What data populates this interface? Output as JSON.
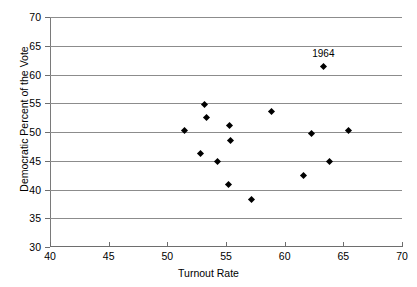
{
  "chart_data": {
    "type": "scatter",
    "title": "",
    "xlabel": "Turnout Rate",
    "ylabel": "Democratic Percent of the Vote",
    "xlim": [
      40,
      70
    ],
    "ylim": [
      30,
      70
    ],
    "xticks": [
      40,
      45,
      50,
      55,
      60,
      65,
      70
    ],
    "yticks": [
      30,
      35,
      40,
      45,
      50,
      55,
      60,
      65,
      70
    ],
    "grid": "horizontal",
    "legend": "none",
    "marker": "filled-diamond",
    "marker_color": "#000000",
    "points": [
      {
        "x": 51.5,
        "y": 50.3
      },
      {
        "x": 52.8,
        "y": 46.2
      },
      {
        "x": 53.2,
        "y": 54.8
      },
      {
        "x": 53.3,
        "y": 52.5
      },
      {
        "x": 54.3,
        "y": 44.8
      },
      {
        "x": 55.3,
        "y": 51.2
      },
      {
        "x": 55.4,
        "y": 48.6
      },
      {
        "x": 55.2,
        "y": 40.8
      },
      {
        "x": 57.2,
        "y": 38.3
      },
      {
        "x": 58.9,
        "y": 53.6
      },
      {
        "x": 61.6,
        "y": 42.5
      },
      {
        "x": 62.3,
        "y": 49.7
      },
      {
        "x": 63.3,
        "y": 61.4,
        "label": "1964"
      },
      {
        "x": 63.8,
        "y": 44.8
      },
      {
        "x": 65.4,
        "y": 50.3
      }
    ],
    "annotations": [
      {
        "text": "1964",
        "x": 63.3,
        "y": 63.6
      }
    ]
  }
}
